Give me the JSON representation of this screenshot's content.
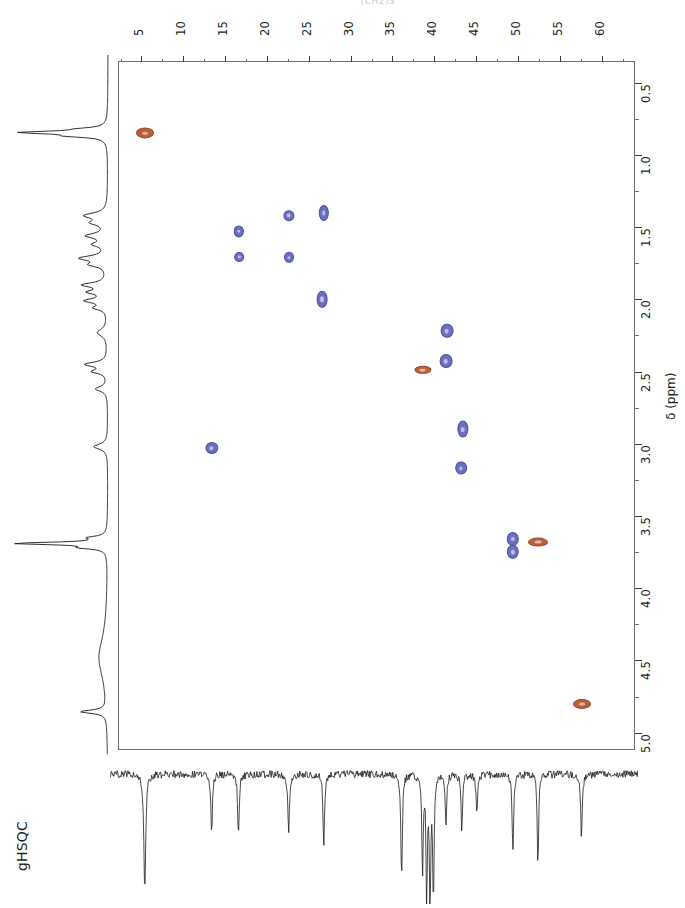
{
  "figure": {
    "experiment_label": "gHSQC",
    "structure_caption": "(CH2)3",
    "frame": {
      "x": 118,
      "y": 61,
      "width": 517,
      "height": 689
    }
  },
  "axis_top": {
    "name": "carbon-13-chemical-shift",
    "unit": "ppm",
    "min": 2.2,
    "max": 64.0,
    "direction": "increasing-left-to-right",
    "major_ticks": [
      5,
      10,
      15,
      20,
      25,
      30,
      35,
      40,
      45,
      50,
      55,
      60
    ],
    "minor_tick_step": 2.5,
    "labels": [
      "5",
      "10",
      "15",
      "20",
      "25",
      "30",
      "35",
      "40",
      "45",
      "50",
      "55",
      "60"
    ]
  },
  "axis_right": {
    "name": "proton-chemical-shift",
    "title": "δ (ppm)",
    "unit": "ppm",
    "min": 0.35,
    "max": 5.12,
    "direction": "increasing-top-to-bottom",
    "major_ticks": [
      0.5,
      1.0,
      1.5,
      2.0,
      2.5,
      3.0,
      3.5,
      4.0,
      4.5,
      5.0
    ],
    "minor_tick_step": 0.25,
    "labels": [
      "0.5",
      "1.0",
      "1.5",
      "2.0",
      "2.5",
      "3.0",
      "3.5",
      "4.0",
      "4.5",
      "5.0"
    ]
  },
  "colors": {
    "positive_peak": "#6b6fc0",
    "positive_peak_edge": "#4a4f9e",
    "negative_peak": "#b9603a",
    "negative_peak_edge": "#9d4a2b",
    "axis": "#3a3a3c",
    "frame": "#6e6e72",
    "trace": "#1a1a1a",
    "text": "#231f20"
  },
  "chart_data": {
    "type": "scatter",
    "title": "gHSQC",
    "xlabel": "δ 13C (ppm)",
    "ylabel": "δ 1H (ppm)",
    "xlim": [
      2.2,
      64.0
    ],
    "ylim": [
      5.12,
      0.35
    ],
    "x_inverted": false,
    "y_inverted": true,
    "grid": false,
    "legend": null,
    "series": [
      {
        "name": "CH / CH3 (positive, blue)",
        "phase": "positive",
        "color": "#6b6fc0",
        "points": [
          {
            "c13": 16.6,
            "h1": 1.53,
            "rx": 4.2,
            "ry": 4.6
          },
          {
            "c13": 22.6,
            "h1": 1.42,
            "rx": 4.6,
            "ry": 4.8
          },
          {
            "c13": 26.8,
            "h1": 1.4,
            "rx": 4.2,
            "ry": 7.0
          },
          {
            "c13": 16.7,
            "h1": 1.71,
            "rx": 3.8,
            "ry": 4.0
          },
          {
            "c13": 22.6,
            "h1": 1.71,
            "rx": 4.0,
            "ry": 4.2
          },
          {
            "c13": 26.6,
            "h1": 2.0,
            "rx": 4.4,
            "ry": 7.2
          },
          {
            "c13": 41.5,
            "h1": 2.22,
            "rx": 5.4,
            "ry": 6.2
          },
          {
            "c13": 41.4,
            "h1": 2.43,
            "rx": 5.4,
            "ry": 6.0
          },
          {
            "c13": 13.4,
            "h1": 3.03,
            "rx": 5.6,
            "ry": 5.0
          },
          {
            "c13": 43.4,
            "h1": 2.9,
            "rx": 4.6,
            "ry": 7.4
          },
          {
            "c13": 43.2,
            "h1": 3.17,
            "rx": 4.8,
            "ry": 5.6
          },
          {
            "c13": 49.4,
            "h1": 3.66,
            "rx": 5.2,
            "ry": 6.0
          },
          {
            "c13": 49.4,
            "h1": 3.75,
            "rx": 5.2,
            "ry": 6.2
          }
        ]
      },
      {
        "name": "CH2 (negative, orange)",
        "phase": "negative",
        "color": "#b9603a",
        "points": [
          {
            "c13": 5.4,
            "h1": 0.85,
            "rx": 8.0,
            "ry": 4.6
          },
          {
            "c13": 38.6,
            "h1": 2.49,
            "rx": 7.6,
            "ry": 3.2
          },
          {
            "c13": 52.4,
            "h1": 3.68,
            "rx": 9.0,
            "ry": 3.4
          },
          {
            "c13": 57.6,
            "h1": 4.8,
            "rx": 8.0,
            "ry": 4.0
          }
        ]
      }
    ],
    "projection_1h": {
      "orientation": "vertical-left",
      "description": "1D 1H projection trace",
      "peaks_ppm": [
        0.85,
        1.42,
        1.58,
        1.72,
        1.9,
        2.02,
        2.22,
        2.45,
        2.62,
        3.02,
        3.18,
        3.7,
        4.5,
        4.85
      ]
    },
    "projection_13c": {
      "orientation": "horizontal-bottom",
      "description": "1D 13C projection trace, peaks point downward, noisy baseline",
      "peaks_ppm": [
        5.4,
        13.4,
        16.6,
        22.6,
        26.8,
        38.6,
        41.4,
        41.9,
        43.3,
        45.1,
        49.4,
        52.4,
        57.6
      ]
    }
  }
}
